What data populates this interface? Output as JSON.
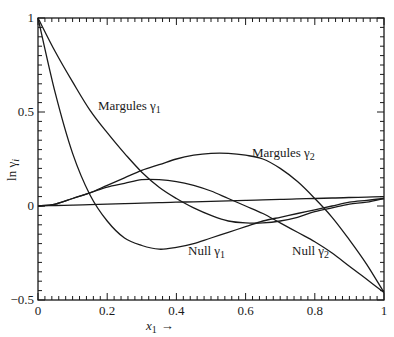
{
  "chart_data": {
    "type": "line",
    "title": "",
    "xlabel": "x1 →",
    "ylabel": "ln γi",
    "xlim": [
      0,
      1
    ],
    "ylim": [
      -0.5,
      1
    ],
    "x_ticks": [
      "0",
      "0.2",
      "0.4",
      "0.6",
      "0.8",
      "1"
    ],
    "y_ticks": [
      "−0.5",
      "0",
      "0.5",
      "1"
    ],
    "grid": false,
    "legend": "inline labels",
    "x": [
      0,
      0.05,
      0.1,
      0.15,
      0.2,
      0.25,
      0.3,
      0.35,
      0.4,
      0.45,
      0.5,
      0.55,
      0.6,
      0.65,
      0.7,
      0.75,
      0.8,
      0.85,
      0.9,
      0.95,
      1.0
    ],
    "series": [
      {
        "name": "Margules γ1",
        "values": [
          1.0,
          0.82,
          0.66,
          0.51,
          0.39,
          0.28,
          0.18,
          0.1,
          0.04,
          -0.01,
          -0.05,
          -0.08,
          -0.09,
          -0.09,
          -0.08,
          -0.06,
          -0.03,
          -0.01,
          0.01,
          0.02,
          0.04
        ]
      },
      {
        "name": "Null γ1",
        "values": [
          1.0,
          0.6,
          0.28,
          0.06,
          -0.08,
          -0.17,
          -0.21,
          -0.23,
          -0.22,
          -0.2,
          -0.17,
          -0.14,
          -0.11,
          -0.08,
          -0.06,
          -0.04,
          -0.02,
          0.0,
          0.02,
          0.03,
          0.04
        ]
      },
      {
        "name": "Margules γ2",
        "values": [
          0.0,
          0.01,
          0.04,
          0.07,
          0.11,
          0.15,
          0.19,
          0.22,
          0.25,
          0.27,
          0.28,
          0.28,
          0.27,
          0.25,
          0.2,
          0.13,
          0.04,
          -0.06,
          -0.18,
          -0.31,
          -0.46
        ]
      },
      {
        "name": "Null γ2",
        "values": [
          0.0,
          0.01,
          0.04,
          0.07,
          0.1,
          0.12,
          0.14,
          0.14,
          0.13,
          0.11,
          0.08,
          0.04,
          0.0,
          -0.04,
          -0.09,
          -0.14,
          -0.19,
          -0.25,
          -0.32,
          -0.39,
          -0.46
        ]
      },
      {
        "name": "Reference line",
        "values": [
          0.0,
          0.0025,
          0.005,
          0.0075,
          0.01,
          0.0125,
          0.015,
          0.0175,
          0.02,
          0.0225,
          0.025,
          0.0275,
          0.03,
          0.0325,
          0.035,
          0.0375,
          0.04,
          0.0425,
          0.045,
          0.0475,
          0.05
        ]
      }
    ],
    "annotations": [
      {
        "text": "Margules γ1",
        "x": 0.29,
        "y": 0.51
      },
      {
        "text": "Margules γ2",
        "x": 0.62,
        "y": 0.3
      },
      {
        "text": "Null γ1",
        "x": 0.46,
        "y": -0.25
      },
      {
        "text": "Null γ2",
        "x": 0.66,
        "y": -0.25
      }
    ]
  },
  "labels": {
    "ylabel_main": "ln γ",
    "ylabel_sub": "i",
    "xlabel_main": "x",
    "xlabel_sub": "1",
    "xlabel_arrow": "→",
    "margules1": "Margules γ",
    "margules1_sub": "1",
    "margules2": "Margules γ",
    "margules2_sub": "2",
    "null1": "Null γ",
    "null1_sub": "1",
    "null2": "Null γ",
    "null2_sub": "2"
  }
}
